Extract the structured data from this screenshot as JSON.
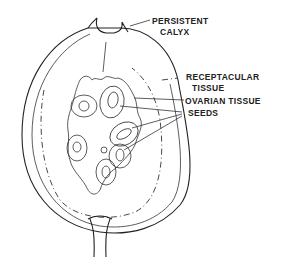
{
  "diagram": {
    "labels": [
      {
        "id": "persistent-calyx",
        "lines": [
          "PERSISTENT",
          "CALYX"
        ]
      },
      {
        "id": "receptacular-tissue",
        "lines": [
          "RECEPTACULAR",
          "TISSUE"
        ]
      },
      {
        "id": "ovarian-tissue",
        "lines": [
          "OVARIAN TISSUE"
        ]
      },
      {
        "id": "seeds",
        "lines": [
          "SEEDS"
        ]
      }
    ],
    "colors": {
      "ink": "#222222",
      "background": "#ffffff"
    }
  }
}
